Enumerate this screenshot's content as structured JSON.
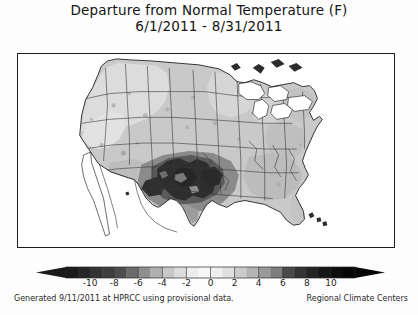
{
  "title": {
    "main": "Departure from Normal Temperature (F)",
    "subtitle": "6/1/2011 - 8/31/2011"
  },
  "footer": {
    "left": "Generated 9/11/2011 at HPRCC using provisional data.",
    "right": "Regional Climate Centers"
  },
  "colorbar": {
    "units": "F",
    "tick_labels": [
      "-10",
      "-8",
      "-6",
      "-4",
      "-2",
      "0",
      "2",
      "4",
      "6",
      "8",
      "10"
    ],
    "tick_values": [
      -10,
      -8,
      -6,
      -4,
      -2,
      0,
      2,
      4,
      6,
      8,
      10
    ],
    "min": -12,
    "max": 12,
    "extend": "both",
    "segment_colors": [
      "#1a1a1a",
      "#262626",
      "#333333",
      "#3f3f3f",
      "#4d4d4d",
      "#6b6b6b",
      "#8f8f8f",
      "#b0b0b0",
      "#c8c8c8",
      "#dcdcdc",
      "#ececec",
      "#f6f6f6",
      "#efefef",
      "#e0e0e0",
      "#cccccc",
      "#b4b4b4",
      "#9a9a9a",
      "#7d7d7d",
      "#4a4a4a",
      "#343434",
      "#242424",
      "#161616",
      "#0d0d0d",
      "#060606"
    ]
  },
  "chart_data": {
    "type": "heatmap",
    "title": "Departure from Normal Temperature (F)",
    "subtitle": "6/1/2011 - 8/31/2011",
    "xlabel": "",
    "ylabel": "",
    "colorbar_label": "Departure from Normal Temperature (F)",
    "units": "degrees Fahrenheit",
    "region": "Contiguous United States",
    "grid": false,
    "legend_position": "bottom",
    "scale_min": -12,
    "scale_max": 12,
    "tick_labels": [
      "-10",
      "-8",
      "-6",
      "-4",
      "-2",
      "0",
      "2",
      "4",
      "6",
      "8",
      "10"
    ],
    "regions": [
      {
        "name": "Texas",
        "departure": 8.5,
        "shade": "very-dark"
      },
      {
        "name": "Oklahoma",
        "departure": 8.0,
        "shade": "very-dark"
      },
      {
        "name": "Kansas",
        "departure": 5.0,
        "shade": "dark"
      },
      {
        "name": "New Mexico (east)",
        "departure": 5.5,
        "shade": "dark"
      },
      {
        "name": "Arkansas",
        "departure": 5.0,
        "shade": "dark"
      },
      {
        "name": "Louisiana",
        "departure": 4.0,
        "shade": "medium-dark"
      },
      {
        "name": "Missouri",
        "departure": 3.0,
        "shade": "medium"
      },
      {
        "name": "Colorado",
        "departure": 2.0,
        "shade": "medium"
      },
      {
        "name": "Nebraska",
        "departure": 2.0,
        "shade": "medium"
      },
      {
        "name": "Mississippi",
        "departure": 3.0,
        "shade": "medium"
      },
      {
        "name": "Alabama",
        "departure": 2.5,
        "shade": "medium"
      },
      {
        "name": "Georgia",
        "departure": 2.5,
        "shade": "medium"
      },
      {
        "name": "Florida",
        "departure": 2.0,
        "shade": "medium"
      },
      {
        "name": "Tennessee",
        "departure": 2.5,
        "shade": "medium"
      },
      {
        "name": "Kentucky",
        "departure": 2.0,
        "shade": "medium"
      },
      {
        "name": "Illinois",
        "departure": 2.0,
        "shade": "medium"
      },
      {
        "name": "Iowa",
        "departure": 2.0,
        "shade": "medium"
      },
      {
        "name": "Minnesota",
        "departure": 1.5,
        "shade": "light-medium"
      },
      {
        "name": "Wisconsin",
        "departure": 1.5,
        "shade": "light-medium"
      },
      {
        "name": "Michigan",
        "departure": 1.5,
        "shade": "light-medium"
      },
      {
        "name": "Ohio",
        "departure": 1.5,
        "shade": "light-medium"
      },
      {
        "name": "Pennsylvania",
        "departure": 2.0,
        "shade": "medium"
      },
      {
        "name": "New York",
        "departure": 2.0,
        "shade": "medium"
      },
      {
        "name": "New England",
        "departure": 2.0,
        "shade": "medium"
      },
      {
        "name": "Virginia",
        "departure": 2.5,
        "shade": "medium"
      },
      {
        "name": "North Carolina",
        "departure": 2.5,
        "shade": "medium"
      },
      {
        "name": "South Carolina",
        "departure": 2.5,
        "shade": "medium"
      },
      {
        "name": "Montana",
        "departure": 1.0,
        "shade": "light"
      },
      {
        "name": "Wyoming",
        "departure": 1.0,
        "shade": "light"
      },
      {
        "name": "Idaho",
        "departure": 0.5,
        "shade": "light"
      },
      {
        "name": "Washington",
        "departure": 0.5,
        "shade": "light"
      },
      {
        "name": "Oregon",
        "departure": 0.5,
        "shade": "light"
      },
      {
        "name": "Nevada",
        "departure": 1.5,
        "shade": "light-medium"
      },
      {
        "name": "Utah",
        "departure": 1.5,
        "shade": "light-medium"
      },
      {
        "name": "Arizona",
        "departure": 2.0,
        "shade": "medium"
      },
      {
        "name": "California",
        "departure": 0.5,
        "shade": "light"
      },
      {
        "name": "North Dakota",
        "departure": 1.0,
        "shade": "light"
      },
      {
        "name": "South Dakota",
        "departure": 2.0,
        "shade": "medium"
      }
    ]
  }
}
